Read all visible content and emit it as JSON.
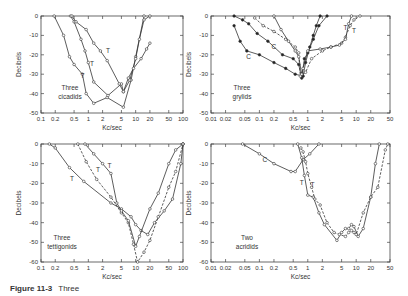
{
  "caption": {
    "label": "Figure 11-3",
    "text": "Three"
  },
  "chart_data": [
    {
      "id": "cicadids",
      "type": "line",
      "panel_label": "Three\ncicadids",
      "xlabel": "Kc/sec",
      "ylabel": "Decibels",
      "xscale": "log",
      "xlim": [
        0.1,
        100
      ],
      "ylim": [
        -50,
        0
      ],
      "xticks": [
        0.1,
        0.2,
        0.5,
        1,
        2,
        5,
        10,
        20,
        50,
        100
      ],
      "xtick_labels": [
        "0.1",
        "0.2",
        "0.5",
        "1",
        "2",
        "5",
        "10",
        "20",
        "50",
        "100"
      ],
      "yticks": [
        0,
        -10,
        -20,
        -30,
        -40,
        -50
      ],
      "ytick_labels": [
        "0",
        "-10",
        "-20",
        "-30",
        "-40",
        "-50"
      ],
      "box": {
        "x0": 41,
        "x1": 183,
        "y0": 16,
        "y1": 113
      },
      "label_pos": {
        "x": 60,
        "y": 90
      },
      "series": [
        {
          "name": "Cicadid 1",
          "style": "solid",
          "marker": "open",
          "label": "T",
          "label_at": [
            0.75,
            -32
          ],
          "x": [
            0.19,
            0.3,
            0.4,
            0.5,
            0.75,
            0.9,
            1.3,
            2.5,
            5.5,
            8,
            10,
            15
          ],
          "y": [
            0,
            -10,
            -21,
            -25,
            -30,
            -40,
            -45,
            -42,
            -47,
            -33,
            -21,
            0
          ]
        },
        {
          "name": "Cicadid 2",
          "style": "solid",
          "marker": "open",
          "label": "T",
          "label_at": [
            1.2,
            -26
          ],
          "x": [
            0.42,
            0.5,
            0.7,
            0.85,
            1.0,
            1.3,
            2.6,
            5.0,
            5.5,
            7.5,
            10,
            12,
            15,
            20
          ],
          "y": [
            0,
            -3,
            -12,
            -18,
            -24,
            -34,
            -41,
            -35,
            -39,
            -33,
            -22,
            -12,
            -2,
            0
          ]
        },
        {
          "name": "Cicadid 3",
          "style": "solid",
          "marker": "open",
          "label": "T",
          "label_at": [
            2.6,
            -19
          ],
          "x": [
            0.45,
            0.55,
            0.9,
            1.3,
            1.8,
            2.5,
            4.5,
            5.5,
            7,
            9,
            13,
            17,
            20
          ],
          "y": [
            0,
            -3,
            -7,
            -14,
            -18,
            -23,
            -35,
            -39,
            -32,
            -27,
            -22,
            -17,
            -14
          ]
        }
      ]
    },
    {
      "id": "grylids",
      "type": "line",
      "panel_label": "Three\ngrylids",
      "xlabel": "Kc/sec",
      "ylabel": "Decibels",
      "xscale": "log",
      "xlim": [
        0.01,
        50
      ],
      "ylim": [
        -50,
        0
      ],
      "xticks": [
        0.01,
        0.02,
        0.05,
        0.1,
        0.2,
        0.5,
        1,
        2,
        5,
        10,
        20,
        50
      ],
      "xtick_labels": [
        "0.01",
        "0.02",
        "0.05",
        "0.1",
        "0.2",
        "0.5",
        "1",
        "2",
        "5",
        "10",
        "20",
        "50"
      ],
      "yticks": [
        0,
        -10,
        -20,
        -30,
        -40,
        -50
      ],
      "ytick_labels": [
        "0",
        "-10",
        "-20",
        "-30",
        "-40",
        "-50"
      ],
      "box": {
        "x0": 211,
        "x1": 390,
        "y0": 16,
        "y1": 113
      },
      "label_pos": {
        "x": 232,
        "y": 90
      },
      "series": [
        {
          "name": "Grylid 1 (C)",
          "style": "solid",
          "marker": "filled",
          "label": "C",
          "label_at": [
            0.06,
            -22
          ],
          "x": [
            0.03,
            0.04,
            0.055,
            0.1,
            0.2,
            0.35,
            0.55,
            0.8,
            0.9,
            1.1,
            1.3,
            1.5,
            1.8
          ],
          "y": [
            -5,
            -13,
            -18,
            -20,
            -24,
            -27,
            -30,
            -31,
            -24,
            -16,
            -10,
            -5,
            0
          ]
        },
        {
          "name": "Grylid 2 (C)",
          "style": "solid",
          "marker": "filled",
          "label": "C",
          "label_at": [
            0.2,
            -17
          ],
          "x": [
            0.03,
            0.045,
            0.06,
            0.09,
            0.15,
            0.3,
            0.5,
            0.65,
            0.75,
            0.85,
            1.0,
            1.3,
            1.7,
            2.5
          ],
          "y": [
            0,
            -2,
            -4,
            -9,
            -13,
            -20,
            -22,
            -25,
            -32,
            -22,
            -19,
            -12,
            -5,
            0
          ]
        },
        {
          "name": "Grylid 3 (T)",
          "style": "dashed",
          "marker": "open",
          "label": "T",
          "label_at": [
            6,
            -7
          ],
          "x": [
            0.08,
            0.12,
            0.2,
            0.35,
            0.55,
            0.65,
            0.7,
            0.9,
            1.2,
            2,
            3,
            5,
            6,
            7.5,
            9,
            12
          ],
          "y": [
            -1,
            -5,
            -8,
            -12,
            -16,
            -19,
            -31,
            -29,
            -22,
            -18,
            -16,
            -14,
            -11,
            -5,
            -2,
            0
          ]
        },
        {
          "name": "Grylid 4 (T)",
          "style": "solid",
          "marker": "open",
          "label": "T",
          "label_at": [
            9,
            -9
          ],
          "x": [
            0.2,
            0.28,
            0.4,
            0.55,
            0.65,
            0.75,
            0.8,
            1.0,
            1.8,
            3,
            4.5,
            6,
            7,
            8
          ],
          "y": [
            0,
            -7,
            -13,
            -18,
            -21,
            -30,
            -27,
            -18,
            -17,
            -16,
            -15,
            -12,
            -4,
            0
          ]
        }
      ]
    },
    {
      "id": "tettigonids",
      "type": "line",
      "panel_label": "Three\ntettigonids",
      "xlabel": "Kc/sec",
      "ylabel": "Decibels",
      "xscale": "log",
      "xlim": [
        0.1,
        100
      ],
      "ylim": [
        -60,
        0
      ],
      "xticks": [
        0.1,
        0.2,
        0.5,
        1,
        2,
        5,
        10,
        20,
        50,
        100
      ],
      "xtick_labels": [
        "0.1",
        "0.2",
        "0.5",
        "1",
        "2",
        "5",
        "10",
        "20",
        "50",
        "100"
      ],
      "yticks": [
        0,
        -10,
        -20,
        -30,
        -40,
        -50,
        -60
      ],
      "ytick_labels": [
        "0",
        "-10",
        "-20",
        "-30",
        "-40",
        "-50",
        "-60"
      ],
      "box": {
        "x0": 41,
        "x1": 183,
        "y0": 144,
        "y1": 262
      },
      "label_pos": {
        "x": 52,
        "y": 240
      },
      "series": [
        {
          "name": "Tettigonid 1",
          "style": "solid",
          "marker": "open",
          "label": "T",
          "label_at": [
            0.45,
            -19
          ],
          "x": [
            0.15,
            0.2,
            0.4,
            0.8,
            3,
            5,
            8,
            10,
            13,
            18,
            25,
            40,
            60,
            90,
            100
          ],
          "y": [
            0,
            -2,
            -12,
            -19,
            -30,
            -33,
            -37,
            -41,
            -44,
            -46,
            -40,
            -34,
            -28,
            -10,
            0
          ]
        },
        {
          "name": "Tettigonid 2",
          "style": "dashed",
          "marker": "open",
          "label": "T",
          "label_at": [
            1.6,
            -14
          ],
          "x": [
            0.6,
            0.9,
            1.5,
            3,
            5,
            7,
            9,
            11,
            15,
            20,
            30,
            50,
            70,
            100
          ],
          "y": [
            0,
            -9,
            -18,
            -27,
            -35,
            -40,
            -51,
            -60,
            -55,
            -49,
            -37,
            -22,
            -14,
            0
          ]
        },
        {
          "name": "Tettigonid 3",
          "style": "solid",
          "marker": "open",
          "label": "T",
          "label_at": [
            2.8,
            -12
          ],
          "x": [
            0.85,
            1.3,
            2,
            3,
            4,
            5,
            7,
            10,
            12,
            20,
            30,
            50,
            70,
            100
          ],
          "y": [
            0,
            -5,
            -10,
            -15,
            -30,
            -34,
            -39,
            -52,
            -47,
            -33,
            -25,
            -10,
            -3,
            0
          ]
        }
      ]
    },
    {
      "id": "acridids",
      "type": "line",
      "panel_label": "Two\nacridids",
      "xlabel": "Kc/sec",
      "ylabel": "Decibels",
      "xscale": "log",
      "xlim": [
        0.01,
        50
      ],
      "ylim": [
        -60,
        0
      ],
      "xticks": [
        0.01,
        0.02,
        0.05,
        0.1,
        0.2,
        0.5,
        1,
        2,
        5,
        10,
        20,
        50
      ],
      "xtick_labels": [
        "0.01",
        "0.02",
        "0.05",
        "0.1",
        "0.2",
        "0.5",
        "1",
        "2",
        "5",
        "10",
        "20",
        "50"
      ],
      "yticks": [
        0,
        -10,
        -20,
        -30,
        -40,
        -50,
        -60
      ],
      "ytick_labels": [
        "0",
        "-10",
        "-20",
        "-30",
        "-40",
        "-50",
        "-60"
      ],
      "box": {
        "x0": 211,
        "x1": 390,
        "y0": 144,
        "y1": 262
      },
      "label_pos": {
        "x": 237,
        "y": 240
      },
      "series": [
        {
          "name": "Acridid (C)",
          "style": "solid",
          "marker": "open",
          "label": "C",
          "label_at": [
            0.13,
            -9
          ],
          "x": [
            0.045,
            0.1,
            0.2,
            0.45,
            0.55,
            0.8,
            1.1,
            1.7
          ],
          "y": [
            0,
            -5,
            -10,
            -14,
            -14,
            -8,
            -5,
            0
          ]
        },
        {
          "name": "Acridid 1 (T)",
          "style": "solid",
          "marker": "open",
          "label": "T",
          "label_at": [
            0.75,
            -21
          ],
          "x": [
            0.62,
            0.75,
            0.85,
            1.0,
            1.3,
            1.7,
            2.2,
            4,
            5,
            6,
            7,
            8,
            9,
            11,
            14,
            20,
            25,
            30
          ],
          "y": [
            0,
            -7,
            -16,
            -26,
            -27,
            -35,
            -41,
            -49,
            -45,
            -43,
            -43,
            -41,
            -42,
            -47,
            -43,
            -27,
            -10,
            0
          ]
        },
        {
          "name": "Acridid 2 (T)",
          "style": "dashed",
          "marker": "open",
          "label": "T",
          "label_at": [
            1.25,
            -22
          ],
          "x": [
            0.72,
            0.8,
            0.9,
            1.0,
            1.2,
            1.4,
            1.8,
            2.5,
            3.5,
            4.5,
            6,
            7,
            8,
            9,
            10,
            14,
            20,
            28,
            40,
            45
          ],
          "y": [
            -2,
            -4,
            -9,
            -15,
            -22,
            -28,
            -31,
            -40,
            -45,
            -46,
            -47,
            -45,
            -44,
            -45,
            -46,
            -35,
            -27,
            -22,
            -3,
            0
          ]
        }
      ]
    }
  ]
}
